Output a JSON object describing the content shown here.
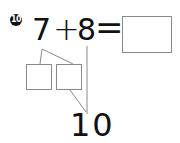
{
  "problem": {
    "number_badge": "10",
    "operand_a": "7",
    "operator": "+",
    "operand_b": "8",
    "equals": "=",
    "answer_box_value": "",
    "decomposition": {
      "left_box_value": "",
      "right_box_value": "",
      "make_ten_target": "10"
    }
  },
  "colors": {
    "text": "#111111",
    "box_border": "#8a8a8a",
    "line": "#8a8a8a"
  }
}
